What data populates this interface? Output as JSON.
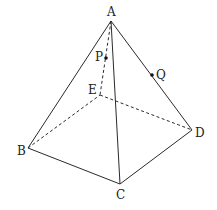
{
  "diagram": {
    "type": "square pyramid",
    "vertices": [
      {
        "id": "A",
        "label": "A"
      },
      {
        "id": "B",
        "label": "B"
      },
      {
        "id": "C",
        "label": "C"
      },
      {
        "id": "D",
        "label": "D"
      },
      {
        "id": "E",
        "label": "E"
      }
    ],
    "points": [
      {
        "id": "P",
        "label": "P",
        "on_edge": "AE"
      },
      {
        "id": "Q",
        "label": "Q",
        "on_edge": "AD"
      }
    ],
    "visible_edges": [
      "AB",
      "AC",
      "AD",
      "BC",
      "CD"
    ],
    "hidden_edges": [
      "AE",
      "BE",
      "DE"
    ],
    "colors": {
      "line": "#2a2a2a",
      "background": "#ffffff"
    }
  }
}
